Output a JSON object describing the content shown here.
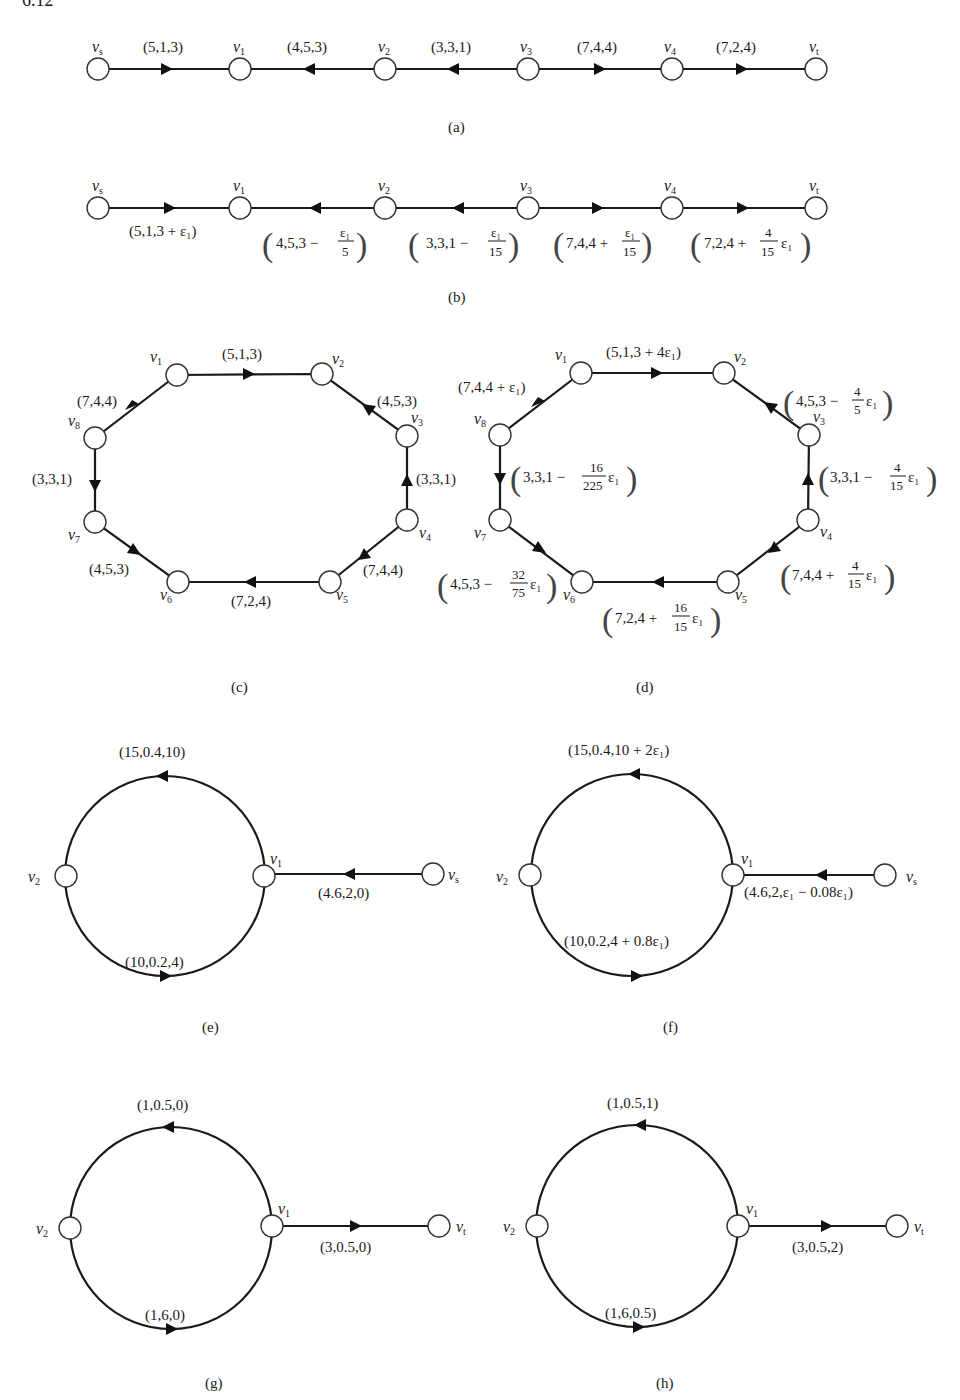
{
  "figure_label": "6.12",
  "panels": {
    "a": {
      "caption": "(a)",
      "nodes": [
        "v_s",
        "v_1",
        "v_2",
        "v_3",
        "v_4",
        "v_t"
      ],
      "node_labels": {
        "vs": "v",
        "vs_sub": "s",
        "v1": "v",
        "v1_sub": "1",
        "v2": "v",
        "v2_sub": "2",
        "v3": "v",
        "v3_sub": "3",
        "v4": "v",
        "v4_sub": "4",
        "vt": "v",
        "vt_sub": "t"
      },
      "edges": [
        {
          "from": "v_s",
          "to": "v_1",
          "label": "(5,1,3)"
        },
        {
          "from": "v_2",
          "to": "v_1",
          "label": "(4,5,3)"
        },
        {
          "from": "v_3",
          "to": "v_2",
          "label": "(3,3,1)"
        },
        {
          "from": "v_3",
          "to": "v_4",
          "label": "(7,4,4)"
        },
        {
          "from": "v_4",
          "to": "v_t",
          "label": "(7,2,4)"
        }
      ]
    },
    "b": {
      "caption": "(b)",
      "node_labels": {
        "vs": "v",
        "vs_sub": "s",
        "v1": "v",
        "v1_sub": "1",
        "v2": "v",
        "v2_sub": "2",
        "v3": "v",
        "v3_sub": "3",
        "v4": "v",
        "v4_sub": "4",
        "vt": "v",
        "vt_sub": "t"
      },
      "edges": [
        {
          "from": "v_s",
          "to": "v_1",
          "label": "(5,1,3 + ε₁)"
        },
        {
          "from": "v_2",
          "to": "v_1",
          "label_main": "4,5,3 −",
          "label_num": "ε₁",
          "label_den": "5"
        },
        {
          "from": "v_3",
          "to": "v_2",
          "label_main": "3,3,1 −",
          "label_num": "ε₁",
          "label_den": "15"
        },
        {
          "from": "v_3",
          "to": "v_4",
          "label_main": "7,4,4 +",
          "label_num": "ε₁",
          "label_den": "15"
        },
        {
          "from": "v_4",
          "to": "v_t",
          "label_main": "7,2,4 +",
          "label_num": "4",
          "label_den": "15",
          "label_tail": "ε₁"
        }
      ]
    },
    "c": {
      "caption": "(c)",
      "node_labels": {
        "v1": "v",
        "v1_sub": "1",
        "v2": "v",
        "v2_sub": "2",
        "v3": "v",
        "v3_sub": "3",
        "v4": "v",
        "v4_sub": "4",
        "v5": "v",
        "v5_sub": "5",
        "v6": "v",
        "v6_sub": "6",
        "v7": "v",
        "v7_sub": "7",
        "v8": "v",
        "v8_sub": "8"
      },
      "edges": [
        {
          "from": "v_1",
          "to": "v_2",
          "label": "(5,1,3)"
        },
        {
          "from": "v_3",
          "to": "v_2",
          "label": "(4,5,3)"
        },
        {
          "from": "v_4",
          "to": "v_3",
          "label": "(3,3,1)"
        },
        {
          "from": "v_4",
          "to": "v_5",
          "label": "(7,4,4)"
        },
        {
          "from": "v_5",
          "to": "v_6",
          "label": "(7,2,4)"
        },
        {
          "from": "v_7",
          "to": "v_6",
          "label": "(4,5,3)"
        },
        {
          "from": "v_8",
          "to": "v_7",
          "label": "(3,3,1)"
        },
        {
          "from": "v_8",
          "to": "v_1",
          "label": "(7,4,4)"
        }
      ]
    },
    "d": {
      "caption": "(d)",
      "node_labels": {
        "v1": "v",
        "v1_sub": "1",
        "v2": "v",
        "v2_sub": "2",
        "v3": "v",
        "v3_sub": "3",
        "v4": "v",
        "v4_sub": "4",
        "v5": "v",
        "v5_sub": "5",
        "v6": "v",
        "v6_sub": "6",
        "v7": "v",
        "v7_sub": "7",
        "v8": "v",
        "v8_sub": "8"
      },
      "edges": [
        {
          "from": "v_1",
          "to": "v_2",
          "label": "(5,1,3 + 4ε₁)"
        },
        {
          "from": "v_3",
          "to": "v_2",
          "label_main": "4,5,3 −",
          "label_num": "4",
          "label_den": "5",
          "label_tail": "ε₁"
        },
        {
          "from": "v_4",
          "to": "v_3",
          "label_main": "3,3,1 −",
          "label_num": "4",
          "label_den": "15",
          "label_tail": "ε₁"
        },
        {
          "from": "v_4",
          "to": "v_5",
          "label_main": "7,4,4 +",
          "label_num": "4",
          "label_den": "15",
          "label_tail": "ε₁"
        },
        {
          "from": "v_5",
          "to": "v_6",
          "label_main": "7,2,4 +",
          "label_num": "16",
          "label_den": "15",
          "label_tail": "ε₁"
        },
        {
          "from": "v_7",
          "to": "v_6",
          "label_main": "4,5,3 −",
          "label_num": "32",
          "label_den": "75",
          "label_tail": "ε₁"
        },
        {
          "from": "v_8",
          "to": "v_7",
          "label_main": "3,3,1 −",
          "label_num": "16",
          "label_den": "225",
          "label_tail": "ε₁"
        },
        {
          "from": "v_8",
          "to": "v_1",
          "label": "(7,4,4 + ε₁)"
        }
      ]
    },
    "e": {
      "caption": "(e)",
      "node_labels": {
        "v1": "v",
        "v1_sub": "1",
        "v2": "v",
        "v2_sub": "2",
        "vs": "v",
        "vs_sub": "s"
      },
      "edges": [
        {
          "from": "v_1",
          "to": "v_2",
          "route": "upper-arc",
          "label": "(15,0.4,10)"
        },
        {
          "from": "v_2",
          "to": "v_1",
          "route": "lower-arc",
          "label": "(10,0.2,4)"
        },
        {
          "from": "v_s",
          "to": "v_1",
          "label": "(4.6,2,0)"
        }
      ]
    },
    "f": {
      "caption": "(f)",
      "node_labels": {
        "v1": "v",
        "v1_sub": "1",
        "v2": "v",
        "v2_sub": "2",
        "vs": "v",
        "vs_sub": "s"
      },
      "edges": [
        {
          "from": "v_1",
          "to": "v_2",
          "route": "upper-arc",
          "label": "(15,0.4,10 + 2ε₁)"
        },
        {
          "from": "v_2",
          "to": "v_1",
          "route": "lower-arc",
          "label": "(10,0.2,4 + 0.8ε₁)"
        },
        {
          "from": "v_s",
          "to": "v_1",
          "label": "(4.6,2,ε₁ − 0.08ε₁)"
        }
      ]
    },
    "g": {
      "caption": "(g)",
      "node_labels": {
        "v1": "v",
        "v1_sub": "1",
        "v2": "v",
        "v2_sub": "2",
        "vt": "v",
        "vt_sub": "t"
      },
      "edges": [
        {
          "from": "v_1",
          "to": "v_2",
          "route": "upper-arc",
          "label": "(1,0.5,0)"
        },
        {
          "from": "v_2",
          "to": "v_1",
          "route": "lower-arc",
          "label": "(1,6,0)"
        },
        {
          "from": "v_1",
          "to": "v_t",
          "label": "(3,0.5,0)"
        }
      ]
    },
    "h": {
      "caption": "(h)",
      "node_labels": {
        "v1": "v",
        "v1_sub": "1",
        "v2": "v",
        "v2_sub": "2",
        "vt": "v",
        "vt_sub": "t"
      },
      "edges": [
        {
          "from": "v_1",
          "to": "v_2",
          "route": "upper-arc",
          "label": "(1,0.5,1)"
        },
        {
          "from": "v_2",
          "to": "v_1",
          "route": "lower-arc",
          "label": "(1,6,0.5)"
        },
        {
          "from": "v_1",
          "to": "v_t",
          "label": "(3,0.5,2)"
        }
      ]
    }
  },
  "colors": {
    "line": "#1a1a1a",
    "node_fill": "#ffffff",
    "background": "#ffffff"
  }
}
